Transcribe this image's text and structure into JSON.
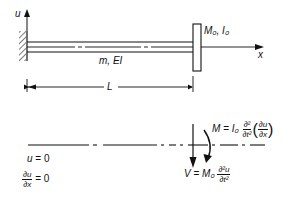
{
  "diagram": {
    "top": {
      "axis_u_label": "u",
      "axis_x_label": "x",
      "beam_label": "m, EI",
      "tip_mass_label": "M₀, I₀",
      "length_label": "L"
    },
    "bottom": {
      "bc_left_1": {
        "lhs": "u",
        "eq": "=",
        "rhs": "0"
      },
      "bc_left_2": {
        "num": "∂u",
        "den": "∂x",
        "eq": "=",
        "rhs": "0"
      },
      "moment_eq": {
        "lhs": "M",
        "eq": "=",
        "coef": "I₀",
        "num": "∂²",
        "den": "∂t²",
        "inner_num": "∂u",
        "inner_den": "∂x"
      },
      "shear_eq": {
        "lhs": "V",
        "eq": "=",
        "coef": "M₀",
        "num": "∂²u",
        "den": "∂t²"
      }
    }
  }
}
